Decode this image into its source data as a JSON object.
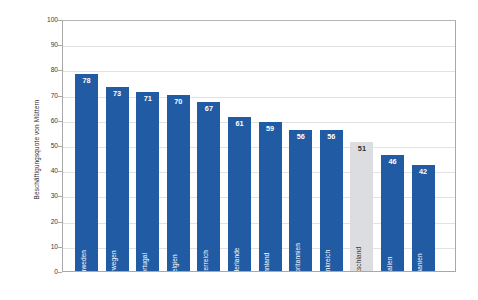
{
  "chart_data": {
    "type": "bar",
    "title": "",
    "subtitle": "",
    "xlabel": "",
    "ylabel": "Beschäftigungsquote von Müttern",
    "ylim": [
      0,
      100
    ],
    "ytick_step": 10,
    "yticks": [
      100,
      90,
      80,
      70,
      60,
      50,
      40,
      30,
      20,
      10,
      0
    ],
    "grid": true,
    "legend": "none",
    "highlight_category": "Deutschland",
    "categories": [
      "Schweden",
      "Norwegen",
      "Portugal",
      "Belgien",
      "Österreich",
      "Niederlande",
      "Finnland",
      "Großbritannien",
      "Frankreich",
      "Deutschland",
      "Italien",
      "Spanien"
    ],
    "values": [
      78,
      73,
      71,
      70,
      67,
      61,
      59,
      56,
      56,
      51,
      46,
      42
    ],
    "bar_colors": [
      "#205BA4",
      "#205BA4",
      "#205BA4",
      "#205BA4",
      "#205BA4",
      "#205BA4",
      "#205BA4",
      "#205BA4",
      "#205BA4",
      "#DCDDE0",
      "#205BA4",
      "#205BA4"
    ],
    "bars": [
      {
        "label": "Schweden",
        "value": 78,
        "highlighted": false
      },
      {
        "label": "Norwegen",
        "value": 73,
        "highlighted": false
      },
      {
        "label": "Portugal",
        "value": 71,
        "highlighted": false
      },
      {
        "label": "Belgien",
        "value": 70,
        "highlighted": false
      },
      {
        "label": "Österreich",
        "value": 67,
        "highlighted": false
      },
      {
        "label": "Niederlande",
        "value": 61,
        "highlighted": false
      },
      {
        "label": "Finnland",
        "value": 59,
        "highlighted": false
      },
      {
        "label": "Großbritannien",
        "value": 56,
        "highlighted": false
      },
      {
        "label": "Frankreich",
        "value": 56,
        "highlighted": false
      },
      {
        "label": "Deutschland",
        "value": 51,
        "highlighted": true
      },
      {
        "label": "Italien",
        "value": 46,
        "highlighted": false
      },
      {
        "label": "Spanien",
        "value": 42,
        "highlighted": false
      }
    ]
  },
  "colors": {
    "bar_blue": "#205BA4",
    "bar_grey": "#DCDDE0",
    "gridline": "#E2E2E2",
    "axis": "#A8A8A8",
    "value_label_on_blue": "#FFFFFF",
    "value_label_on_grey": "#2F2F2F",
    "background": "#FFFFFF"
  }
}
